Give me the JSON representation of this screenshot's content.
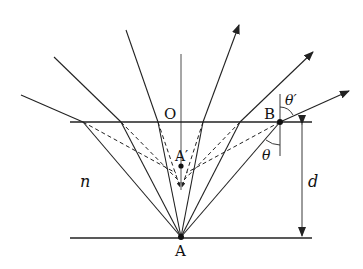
{
  "diagram": {
    "labels": {
      "O": "O",
      "A": "A",
      "A_prime": "A′",
      "B": "B",
      "theta": "θ",
      "theta_prime": "θ′",
      "n": "n",
      "d": "d"
    },
    "colors": {
      "line": "#222222",
      "background": "#ffffff"
    }
  }
}
